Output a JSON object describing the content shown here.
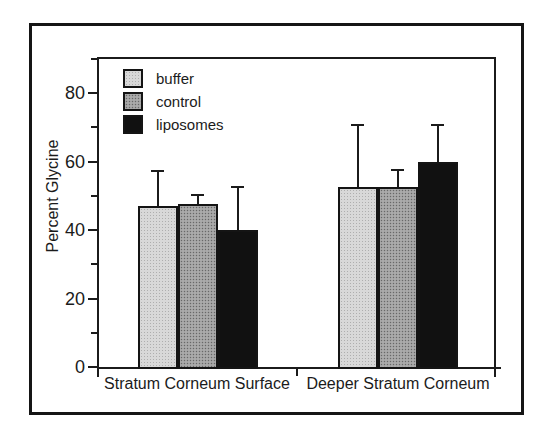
{
  "figure": {
    "background": "#ffffff",
    "frame_color": "#151515",
    "axis_color": "#1b1b1b"
  },
  "chart_data": {
    "type": "bar",
    "title": "",
    "xlabel": "",
    "ylabel": "Percent Glycine",
    "categories": [
      "Stratum Corneum Surface",
      "Deeper Stratum Corneum"
    ],
    "series": [
      {
        "name": "buffer",
        "color": "#d8d8d8",
        "values": [
          47,
          52.5
        ],
        "error_plus": [
          10.5,
          18.5
        ]
      },
      {
        "name": "control",
        "color": "#a0a0a0",
        "values": [
          47.5,
          52.5
        ],
        "error_plus": [
          3,
          5.5
        ]
      },
      {
        "name": "liposomes",
        "color": "#111111",
        "values": [
          40,
          60
        ],
        "error_plus": [
          13,
          11
        ]
      }
    ],
    "ylim": [
      0,
      90
    ],
    "yticks": [
      0,
      20,
      40,
      60,
      80
    ],
    "yticks_minor": [
      10,
      30,
      50,
      70,
      90
    ],
    "grid": false,
    "legend_position": "top-left",
    "error_bars": "upper-only-with-caps"
  }
}
